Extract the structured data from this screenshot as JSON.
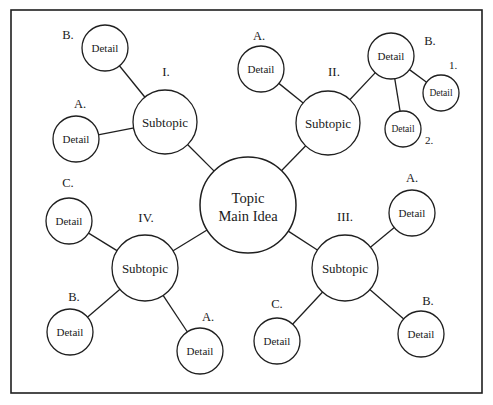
{
  "diagram": {
    "frame": {
      "x": 11,
      "y": 10,
      "width": 471,
      "height": 383,
      "stroke": "#1f1f1f"
    },
    "colors": {
      "stroke": "#1f1f1f",
      "fill": "#ffffff",
      "text": "#1a1a1a"
    },
    "center": {
      "id": "center",
      "line1": "Topic",
      "line2": "Main Idea",
      "cx": 248,
      "cy": 205,
      "r": 48,
      "font_size": 14.5
    },
    "nodes": [
      {
        "id": "subtopic-1",
        "text": "Subtopic",
        "marker": "I.",
        "marker_x": 166,
        "marker_y": 76,
        "cx": 165,
        "cy": 122,
        "r": 32,
        "font_size": 13
      },
      {
        "id": "detail-1-a",
        "text": "Detail",
        "marker": "A.",
        "marker_x": 80,
        "marker_y": 108,
        "cx": 76,
        "cy": 139,
        "r": 23,
        "font_size": 11
      },
      {
        "id": "detail-1-b",
        "text": "Detail",
        "marker": "B.",
        "marker_x": 68,
        "marker_y": 39,
        "cx": 105,
        "cy": 48,
        "r": 23,
        "font_size": 11
      },
      {
        "id": "subtopic-2",
        "text": "Subtopic",
        "marker": "II.",
        "marker_x": 334,
        "marker_y": 76,
        "cx": 328,
        "cy": 123,
        "r": 32,
        "font_size": 13
      },
      {
        "id": "detail-2-a",
        "text": "Detail",
        "marker": "A.",
        "marker_x": 259,
        "marker_y": 40,
        "cx": 261,
        "cy": 69,
        "r": 23,
        "font_size": 11
      },
      {
        "id": "detail-2-b",
        "text": "Detail",
        "marker": "B.",
        "marker_x": 430,
        "marker_y": 45,
        "cx": 391,
        "cy": 56,
        "r": 23,
        "font_size": 11
      },
      {
        "id": "detail-2-b-1",
        "text": "Detail",
        "marker": "1.",
        "marker_x": 453,
        "marker_y": 69,
        "cx": 441,
        "cy": 93,
        "r": 18,
        "font_size": 9.5
      },
      {
        "id": "detail-2-b-2",
        "text": "Detail",
        "marker": "2.",
        "marker_x": 429,
        "marker_y": 144,
        "cx": 403,
        "cy": 129,
        "r": 18,
        "font_size": 9.5
      },
      {
        "id": "subtopic-3",
        "text": "Subtopic",
        "marker": "III.",
        "marker_x": 345,
        "marker_y": 221,
        "cx": 345,
        "cy": 268,
        "r": 33,
        "font_size": 13
      },
      {
        "id": "detail-3-a",
        "text": "Detail",
        "marker": "A.",
        "marker_x": 412,
        "marker_y": 182,
        "cx": 412,
        "cy": 213,
        "r": 23,
        "font_size": 11
      },
      {
        "id": "detail-3-b",
        "text": "Detail",
        "marker": "B.",
        "marker_x": 428,
        "marker_y": 305,
        "cx": 421,
        "cy": 334,
        "r": 23,
        "font_size": 11
      },
      {
        "id": "detail-3-c",
        "text": "Detail",
        "marker": "C.",
        "marker_x": 277,
        "marker_y": 308,
        "cx": 277,
        "cy": 341,
        "r": 23,
        "font_size": 11
      },
      {
        "id": "subtopic-4",
        "text": "Subtopic",
        "marker": "IV.",
        "marker_x": 146,
        "marker_y": 222,
        "cx": 145,
        "cy": 268,
        "r": 33,
        "font_size": 13
      },
      {
        "id": "detail-4-a",
        "text": "Detail",
        "marker": "A.",
        "marker_x": 208,
        "marker_y": 321,
        "cx": 200,
        "cy": 351,
        "r": 23,
        "font_size": 11
      },
      {
        "id": "detail-4-b",
        "text": "Detail",
        "marker": "B.",
        "marker_x": 74,
        "marker_y": 301,
        "cx": 70,
        "cy": 332,
        "r": 23,
        "font_size": 11
      },
      {
        "id": "detail-4-c",
        "text": "Detail",
        "marker": "C.",
        "marker_x": 68,
        "marker_y": 187,
        "cx": 69,
        "cy": 221,
        "r": 23,
        "font_size": 11
      }
    ],
    "edges": [
      {
        "from": "center",
        "to": "subtopic-1"
      },
      {
        "from": "center",
        "to": "subtopic-2"
      },
      {
        "from": "center",
        "to": "subtopic-3"
      },
      {
        "from": "center",
        "to": "subtopic-4"
      },
      {
        "from": "subtopic-1",
        "to": "detail-1-a"
      },
      {
        "from": "subtopic-1",
        "to": "detail-1-b"
      },
      {
        "from": "subtopic-2",
        "to": "detail-2-a"
      },
      {
        "from": "subtopic-2",
        "to": "detail-2-b"
      },
      {
        "from": "detail-2-b",
        "to": "detail-2-b-1"
      },
      {
        "from": "detail-2-b",
        "to": "detail-2-b-2"
      },
      {
        "from": "subtopic-3",
        "to": "detail-3-a"
      },
      {
        "from": "subtopic-3",
        "to": "detail-3-b"
      },
      {
        "from": "subtopic-3",
        "to": "detail-3-c"
      },
      {
        "from": "subtopic-4",
        "to": "detail-4-a"
      },
      {
        "from": "subtopic-4",
        "to": "detail-4-b"
      },
      {
        "from": "subtopic-4",
        "to": "detail-4-c"
      }
    ]
  }
}
